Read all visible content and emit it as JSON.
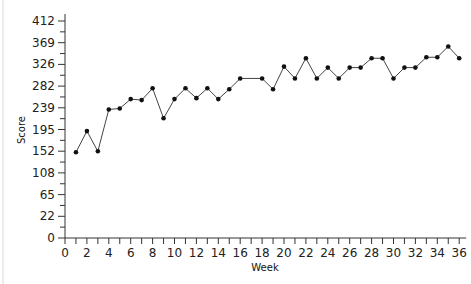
{
  "chart_data": {
    "type": "line",
    "title": "",
    "xlabel": "Week",
    "ylabel": "Score",
    "x_ticks": [
      0,
      2,
      4,
      6,
      8,
      10,
      12,
      14,
      16,
      18,
      20,
      22,
      24,
      26,
      28,
      30,
      32,
      34,
      36
    ],
    "y_ticks": [
      0,
      22,
      65,
      108,
      152,
      195,
      239,
      282,
      326,
      369,
      412
    ],
    "xlim": [
      0,
      36
    ],
    "ylim": [
      0,
      430
    ],
    "grid": false,
    "legend": null,
    "series": [
      {
        "name": "Score",
        "color": "#333333",
        "marker": "circle",
        "x": [
          1,
          2,
          3,
          4,
          5,
          6,
          7,
          8,
          9,
          10,
          11,
          12,
          13,
          14,
          15,
          16,
          18,
          19,
          20,
          21,
          22,
          23,
          24,
          25,
          26,
          27,
          28,
          29,
          30,
          31,
          32,
          33,
          34,
          35,
          36
        ],
        "values": [
          152,
          195,
          154,
          239,
          241,
          260,
          258,
          282,
          221,
          260,
          282,
          262,
          282,
          260,
          280,
          302,
          302,
          280,
          326,
          302,
          343,
          302,
          324,
          302,
          324,
          324,
          343,
          343,
          302,
          324,
          324,
          345,
          345,
          367,
          343
        ]
      }
    ]
  }
}
